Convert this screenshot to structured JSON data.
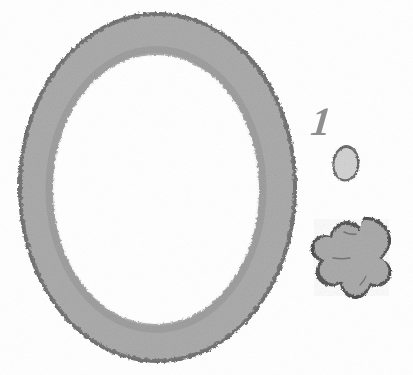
{
  "figure": {
    "label": "1",
    "label_color": "#8e8e8e",
    "background_color": "#ffffff",
    "width": 413,
    "height": 375,
    "fill_color": "#a9a9a9",
    "fill_color_light": "#d2d2d2",
    "edge_color": "#4a4a4a",
    "shapes": [
      {
        "name": "annulus-ring",
        "kind": "ring",
        "fill": "#a9a9a9",
        "edge": "#4a4a4a",
        "outer_bounds": {
          "x": 20,
          "y": 14,
          "width": 275,
          "height": 347
        },
        "inner_bounds": {
          "x": 55,
          "y": 56,
          "width": 202,
          "height": 267
        }
      },
      {
        "name": "small-round-blob",
        "kind": "blob",
        "fill": "#d2d2d2",
        "edge": "#5a5a5a",
        "bounds": {
          "x": 333,
          "y": 146,
          "width": 26,
          "height": 35
        }
      },
      {
        "name": "lobed-flower-blob",
        "kind": "blob",
        "fill": "#a9a9a9",
        "edge": "#3f3f3f",
        "bounds": {
          "x": 312,
          "y": 217,
          "width": 80,
          "height": 84
        }
      }
    ]
  }
}
